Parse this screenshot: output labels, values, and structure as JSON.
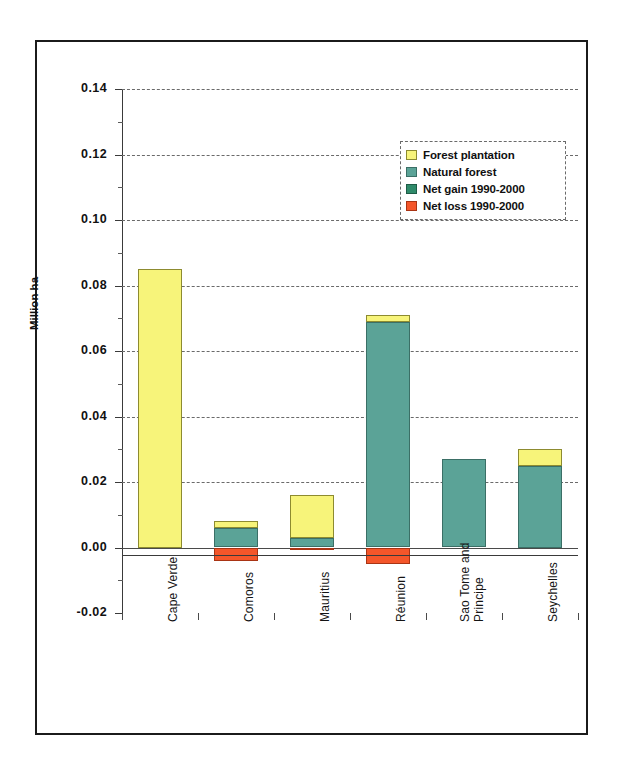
{
  "chart_data": {
    "type": "bar",
    "title": "",
    "xlabel": "",
    "ylabel": "Million ha",
    "ylim": [
      -0.02,
      0.14
    ],
    "ytick_labels": [
      "0.14",
      "0.12",
      "0.10",
      "0.08",
      "0.06",
      "0.04",
      "0.02",
      "0.00",
      "-0.02"
    ],
    "ytick_values": [
      0.14,
      0.12,
      0.1,
      0.08,
      0.06,
      0.04,
      0.02,
      0.0,
      -0.02
    ],
    "grid": "horizontal-dashed",
    "legend_position": "upper-right",
    "stacked": true,
    "categories": [
      "Cape Verde",
      "Comoros",
      "Mauritius",
      "Réunion",
      "Sao Tome and Principe",
      "Seychelles"
    ],
    "series": [
      {
        "name": "Forest plantation",
        "color": "#f7f47a",
        "values": [
          0.085,
          0.002,
          0.013,
          0.002,
          0.0,
          0.005
        ]
      },
      {
        "name": "Natural forest",
        "color": "#5ba397",
        "values": [
          0.0,
          0.006,
          0.003,
          0.069,
          0.027,
          0.025
        ]
      },
      {
        "name": "Net gain 1990-2000",
        "color": "#2f8a6a",
        "values": [
          0.0,
          0.0,
          0.0,
          0.0,
          0.0,
          0.0
        ]
      },
      {
        "name": "Net loss 1990-2000",
        "color": "#f4562a",
        "values": [
          0.0,
          -0.004,
          -0.0008,
          -0.005,
          0.0,
          0.0
        ]
      }
    ],
    "bar_totals": [
      0.085,
      0.008,
      0.016,
      0.071,
      0.027,
      0.03
    ]
  },
  "axis": {
    "y_title": "Million ha"
  },
  "legend": {
    "items": [
      {
        "label": "Forest plantation",
        "swatch": "plantation"
      },
      {
        "label": "Natural forest",
        "swatch": "natural"
      },
      {
        "label": "Net gain 1990-2000",
        "swatch": "netgain"
      },
      {
        "label": "Net loss 1990-2000",
        "swatch": "netloss"
      }
    ]
  },
  "x_axis": {
    "labels": [
      {
        "line1": "Cape Verde",
        "line2": ""
      },
      {
        "line1": "Comoros",
        "line2": ""
      },
      {
        "line1": "Mauritius",
        "line2": ""
      },
      {
        "line1": "Réunion",
        "line2": ""
      },
      {
        "line1": "Sao Tome and",
        "line2": "Principe"
      },
      {
        "line1": "Seychelles",
        "line2": ""
      }
    ]
  },
  "y_axis": {
    "ticks": [
      "0.14",
      "0.12",
      "0.10",
      "0.08",
      "0.06",
      "0.04",
      "0.02",
      "0.00",
      "-0.02"
    ]
  }
}
